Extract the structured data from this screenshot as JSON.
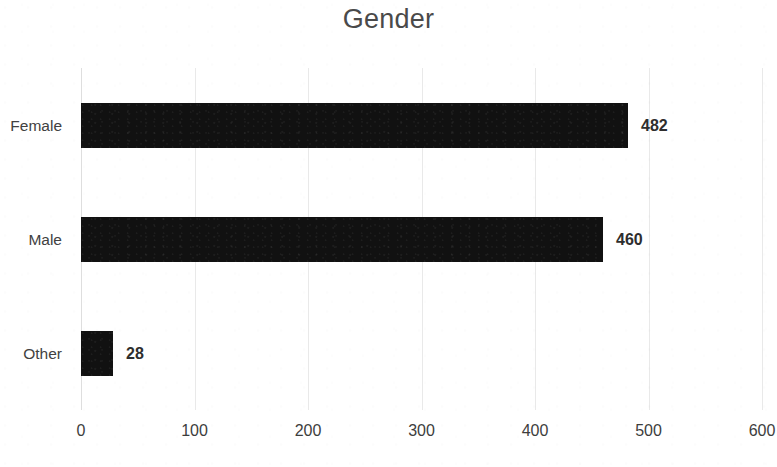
{
  "chart_data": {
    "type": "bar",
    "orientation": "horizontal",
    "title": "Gender",
    "xlabel": "",
    "ylabel": "",
    "categories": [
      "Female",
      "Male",
      "Other"
    ],
    "values": [
      482,
      460,
      28
    ],
    "data_labels": [
      "482",
      "460",
      "28"
    ],
    "xlim": [
      0,
      600
    ],
    "xticks": [
      0,
      100,
      200,
      300,
      400,
      500,
      600
    ],
    "xtick_labels": [
      "0",
      "100",
      "200",
      "300",
      "400",
      "500",
      "600"
    ],
    "grid": "vertical",
    "legend": "none",
    "series": [
      {
        "name": "Count",
        "values": [
          482,
          460,
          28
        ]
      }
    ],
    "colors": {
      "bar": "#111111",
      "gridline": "#e9e9e9",
      "title_text": "#4a4a4a",
      "label_text": "#3f3f3f",
      "background": "#ffffff"
    }
  }
}
